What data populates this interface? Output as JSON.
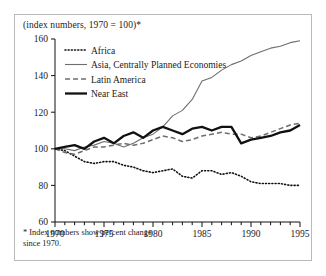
{
  "figure": {
    "title": "(index numbers, 1970 = 100)*",
    "footnote": "* Index numbers show percent change\nsince 1970."
  },
  "chart_data": {
    "type": "line",
    "title": "(index numbers, 1970 = 100)*",
    "xlabel": "",
    "ylabel": "",
    "xlim": [
      1970,
      1995
    ],
    "ylim": [
      60,
      160
    ],
    "yticks": [
      60,
      80,
      100,
      120,
      140,
      160
    ],
    "xticks": [
      1970,
      1975,
      1980,
      1985,
      1990,
      1995
    ],
    "xtick_minor_step": 1,
    "grid": false,
    "legend_position": "top-left",
    "x": [
      1970,
      1971,
      1972,
      1973,
      1974,
      1975,
      1976,
      1977,
      1978,
      1979,
      1980,
      1981,
      1982,
      1983,
      1984,
      1985,
      1986,
      1987,
      1988,
      1989,
      1990,
      1991,
      1992,
      1993,
      1994,
      1995
    ],
    "series": [
      {
        "name": "Africa",
        "style": "dotted",
        "color": "#111111",
        "width": 1.6,
        "values": [
          100,
          99,
          96,
          93,
          92,
          93,
          93,
          91,
          90,
          88,
          87,
          88,
          89,
          85,
          84,
          88,
          88,
          86,
          87,
          85,
          82,
          81,
          81,
          81,
          80,
          80
        ]
      },
      {
        "name": "Asia, Centrally Planned Economies",
        "style": "solid-thin",
        "color": "#6e6e6e",
        "width": 1.1,
        "values": [
          100,
          100,
          99,
          101,
          102,
          104,
          103,
          101,
          103,
          106,
          108,
          112,
          118,
          121,
          127,
          137,
          139,
          143,
          146,
          148,
          151,
          153,
          155,
          156,
          158,
          159
        ]
      },
      {
        "name": "Latin America",
        "style": "dashed",
        "color": "#6e6e6e",
        "width": 1.5,
        "values": [
          100,
          98,
          97,
          99,
          101,
          101,
          102,
          103,
          102,
          103,
          105,
          107,
          106,
          104,
          105,
          107,
          108,
          109,
          108,
          108,
          106,
          107,
          109,
          111,
          113,
          114
        ]
      },
      {
        "name": "Near East",
        "style": "solid-thick",
        "color": "#111111",
        "width": 2.3,
        "values": [
          100,
          101,
          102,
          100,
          104,
          106,
          103,
          107,
          109,
          106,
          110,
          112,
          110,
          108,
          111,
          112,
          110,
          112,
          112,
          103,
          105,
          106,
          107,
          109,
          110,
          113
        ]
      }
    ]
  },
  "legend": {
    "items": [
      {
        "label": "Africa"
      },
      {
        "label": "Asia, Centrally Planned Economies"
      },
      {
        "label": "Latin America"
      },
      {
        "label": "Near East"
      }
    ]
  }
}
